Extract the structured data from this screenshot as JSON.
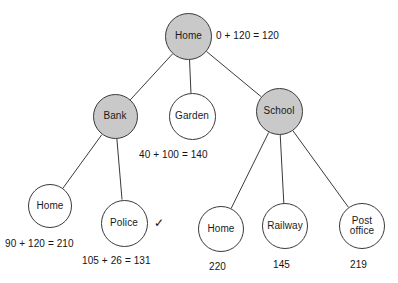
{
  "diagram": {
    "type": "search-tree",
    "colors": {
      "expanded_node_fill": "#c9c9c9",
      "frontier_node_fill": "#ffffff",
      "stroke": "#3a3a3a",
      "text": "#141414",
      "background": "#ffffff"
    },
    "goal_marker": "✓",
    "nodes": [
      {
        "id": "root-home",
        "label": "Home",
        "state": "expanded",
        "cx": 188.5,
        "cy": 36.5,
        "r": 23.5,
        "cost": "0 + 120 = 120",
        "cost_x": 216,
        "cost_y": 30,
        "goal": false
      },
      {
        "id": "bank",
        "label": "Bank",
        "state": "expanded",
        "cx": 115,
        "cy": 116.5,
        "r": 22.5,
        "cost": "",
        "cost_x": 0,
        "cost_y": 0,
        "goal": false
      },
      {
        "id": "garden",
        "label": "Garden",
        "state": "frontier",
        "cx": 192,
        "cy": 116.5,
        "r": 23.5,
        "cost": "40 + 100 = 140",
        "cost_x": 139,
        "cost_y": 149,
        "goal": false
      },
      {
        "id": "school",
        "label": "School",
        "state": "expanded",
        "cx": 279,
        "cy": 111.5,
        "r": 23.5,
        "cost": "",
        "cost_x": 0,
        "cost_y": 0,
        "goal": false
      },
      {
        "id": "bank-home",
        "label": "Home",
        "state": "frontier",
        "cx": 50,
        "cy": 206,
        "r": 22,
        "cost": "90 + 120 = 210",
        "cost_x": 5,
        "cost_y": 238,
        "goal": false
      },
      {
        "id": "police",
        "label": "Police",
        "state": "frontier",
        "cx": 124,
        "cy": 223,
        "r": 23.5,
        "cost": "105 + 26 = 131",
        "cost_x": 82,
        "cost_y": 255,
        "goal": true
      },
      {
        "id": "school-home",
        "label": "Home",
        "state": "frontier",
        "cx": 221,
        "cy": 229,
        "r": 23,
        "cost": "220",
        "cost_x": 209,
        "cost_y": 261,
        "goal": false
      },
      {
        "id": "railway",
        "label": "Railway",
        "state": "frontier",
        "cx": 285,
        "cy": 226,
        "r": 23,
        "cost": "145",
        "cost_x": 273,
        "cost_y": 259,
        "goal": false
      },
      {
        "id": "post-office",
        "label": "Post office",
        "label_lines": [
          "Post",
          "office"
        ],
        "state": "frontier",
        "cx": 362,
        "cy": 226,
        "r": 23,
        "cost": "219",
        "cost_x": 350,
        "cost_y": 259,
        "goal": false
      }
    ],
    "edges": [
      {
        "from": "root-home",
        "to": "bank"
      },
      {
        "from": "root-home",
        "to": "garden"
      },
      {
        "from": "root-home",
        "to": "school"
      },
      {
        "from": "bank",
        "to": "bank-home"
      },
      {
        "from": "bank",
        "to": "police"
      },
      {
        "from": "school",
        "to": "school-home"
      },
      {
        "from": "school",
        "to": "railway"
      },
      {
        "from": "school",
        "to": "post-office"
      }
    ]
  }
}
